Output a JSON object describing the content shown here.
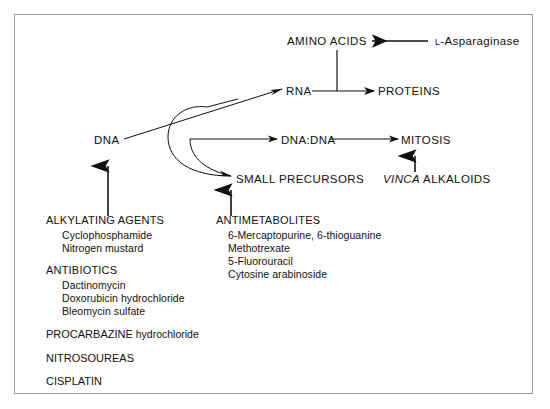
{
  "figure": {
    "type": "flow-diagram",
    "title_visible": "",
    "border_color": "#9a9a9a",
    "ink_color": "#111111"
  },
  "nodes": {
    "amino_acids": "AMINO  ACIDS",
    "rna": "RNA",
    "proteins": "PROTEINS",
    "dna": "DNA",
    "dna_dna": "DNA:DNA",
    "mitosis": "MITOSIS",
    "small_precursors": "SMALL  PRECURSORS"
  },
  "agents": {
    "asparaginase_prefix": "L",
    "asparaginase_rest": "-Asparaginase",
    "vinca_italic": "VINCA",
    "vinca_rest": " ALKALOIDS"
  },
  "left_column": {
    "group1": {
      "heading": "ALKYLATING AGENTS",
      "items": [
        "Cyclophosphamide",
        "Nitrogen mustard"
      ]
    },
    "group2": {
      "heading": "ANTIBIOTICS",
      "items": [
        "Dactinomycin",
        "Doxorubicin hydrochloride",
        "Bleomycin sulfate"
      ]
    },
    "singles": [
      {
        "caps": "PROCARBAZINE",
        "rest": " hydrochloride"
      },
      {
        "caps": "NITROSOUREAS",
        "rest": ""
      },
      {
        "caps": "CISPLATIN",
        "rest": ""
      }
    ]
  },
  "right_column": {
    "group1": {
      "heading": "ANTIMETABOLITES",
      "items": [
        "6-Mercaptopurine, 6-thioguanine",
        "Methotrexate",
        "5-Fluorouracil",
        "Cytosine arabinoside"
      ]
    }
  },
  "edges": [
    {
      "from": "L-Asparaginase",
      "to": "AMINO  ACIDS",
      "style": "thick-arrow-left"
    },
    {
      "from": "AMINO  ACIDS",
      "to": "RNA-PROTEINS line",
      "style": "plain-vertical"
    },
    {
      "from": "RNA",
      "to": "PROTEINS",
      "style": "thin-arrow-right"
    },
    {
      "from": "DNA",
      "to": "RNA",
      "style": "thin-arrow-right-diagonal"
    },
    {
      "from": "SMALL  PRECURSORS",
      "to": "RNA",
      "style": "curve-outer"
    },
    {
      "from": "SMALL  PRECURSORS",
      "to": "DNA:DNA",
      "style": "curve-inner"
    },
    {
      "from": "DNA:DNA",
      "to": "MITOSIS",
      "style": "thin-arrow-right"
    },
    {
      "from": "VINCA ALKALOIDS",
      "to": "MITOSIS",
      "style": "thick-arrow-up"
    },
    {
      "from": "ALKYLATING AGENTS",
      "to": "DNA",
      "style": "thick-arrow-up"
    },
    {
      "from": "ANTIMETABOLITES",
      "to": "SMALL  PRECURSORS",
      "style": "thick-arrow-up"
    }
  ]
}
